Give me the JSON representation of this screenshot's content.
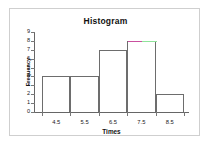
{
  "chart_data": {
    "type": "bar",
    "title": "Histogram",
    "xlabel": "Times",
    "ylabel": "Frequency",
    "categories": [
      "4.5",
      "5.5",
      "6.5",
      "7.5",
      "8.5"
    ],
    "values": [
      4,
      4,
      7,
      8,
      2
    ],
    "ylim": [
      0,
      9
    ],
    "y_ticks": [
      "0",
      "1",
      "2",
      "3",
      "4",
      "5",
      "6",
      "7",
      "8",
      "9"
    ],
    "x_ticks": [
      "4.5",
      "5.5",
      "6.5",
      "7.5",
      "8.5"
    ],
    "grid": false,
    "legend": "none",
    "bar_edge_color": "#6d6d6d",
    "bar_fill_color": "#ffffff",
    "axis_color": "#666666",
    "highlight": {
      "bar_index": 3,
      "left_color": "#c9509f",
      "right_color": "#8fe39a"
    },
    "frame_color": "#cfcfcf",
    "background_color": "#ffffff"
  }
}
